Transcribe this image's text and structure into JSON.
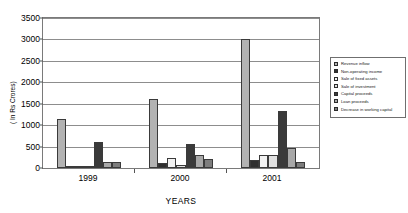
{
  "chart_data": {
    "type": "bar",
    "title": "",
    "xlabel": "YEARS",
    "ylabel": "( In Rs Crores)",
    "categories": [
      "1999",
      "2000",
      "2001"
    ],
    "ylim": [
      0,
      3500
    ],
    "ytick_step": 500,
    "yticks": [
      "0",
      "500",
      "1000",
      "1500",
      "2000",
      "2500",
      "3000",
      "3500"
    ],
    "grid": true,
    "legend_position": "right",
    "series": [
      {
        "name": "Revenue inflow",
        "color": "#b3b3b3",
        "values": [
          1150,
          1620,
          3010
        ]
      },
      {
        "name": "Non-operating income",
        "color": "#2f2f2f",
        "values": [
          25,
          120,
          185
        ]
      },
      {
        "name": "Sale of fixed assets",
        "color": "#f2f2f2",
        "values": [
          15,
          235,
          300
        ]
      },
      {
        "name": "Sale of investment",
        "color": "#e0e0e0",
        "values": [
          10,
          60,
          310
        ]
      },
      {
        "name": "Capital proceeds",
        "color": "#3a3a3a",
        "values": [
          600,
          570,
          1330
        ]
      },
      {
        "name": "Loan proceeds",
        "color": "#a8a8a8",
        "values": [
          150,
          300,
          460
        ]
      },
      {
        "name": "Decrease in working capital",
        "color": "#7d7d7d",
        "values": [
          140,
          215,
          150
        ]
      }
    ]
  }
}
